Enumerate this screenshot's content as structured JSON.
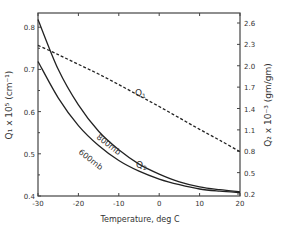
{
  "chart_data": {
    "type": "line",
    "title": "",
    "xlabel": "Temperature, deg C",
    "ylabel_left": "Q1 x 10^5 (cm^-1)",
    "ylabel_right": "Q2 x 10^-3 (gm/gm)",
    "xlim": [
      -30,
      20
    ],
    "ylim_left": [
      0.4,
      0.82
    ],
    "ylim_right": [
      0.2,
      2.6
    ],
    "x_ticks": [
      "-30",
      "-20",
      "-10",
      "0",
      "10",
      "20"
    ],
    "y_left_ticks": [
      "0.4",
      "0.5",
      "0.6",
      "0.7",
      "0.8"
    ],
    "y_right_ticks": [
      "0.2",
      "0.5",
      "0.8",
      "1.1",
      "1.4",
      "1.7",
      "2.0",
      "2.3",
      "2.6"
    ],
    "grid": false,
    "series": [
      {
        "name": "Q1",
        "axis": "left",
        "style": "dashed",
        "x": [
          -30,
          -25,
          -20,
          -15,
          -10,
          -5,
          0,
          5,
          10,
          15,
          20
        ],
        "values": [
          0.757,
          0.735,
          0.712,
          0.689,
          0.664,
          0.638,
          0.612,
          0.585,
          0.558,
          0.532,
          0.505
        ]
      },
      {
        "name": "Q2 800mb",
        "axis": "right",
        "style": "solid",
        "x": [
          -30,
          -25,
          -20,
          -15,
          -10,
          -5,
          0,
          5,
          10,
          15,
          20
        ],
        "values": [
          2.65,
          1.95,
          1.45,
          1.08,
          0.82,
          0.62,
          0.48,
          0.37,
          0.3,
          0.26,
          0.23
        ]
      },
      {
        "name": "Q2 600mb",
        "axis": "right",
        "style": "solid",
        "x": [
          -30,
          -25,
          -20,
          -15,
          -10,
          -5,
          0,
          5,
          10,
          15,
          20
        ],
        "values": [
          2.06,
          1.55,
          1.16,
          0.88,
          0.67,
          0.52,
          0.41,
          0.33,
          0.27,
          0.24,
          0.22
        ]
      }
    ],
    "annotations": [
      "Q1",
      "Q2",
      "800mb",
      "600mb"
    ]
  },
  "labels": {
    "xlabel": "Temperature, deg C",
    "q1": "Q",
    "q1_sub": "1",
    "q2": "Q",
    "q2_sub": "2",
    "mb800": "800mb",
    "mb600": "600mb",
    "yleft": "Q₁ x 10⁵ (cm⁻¹)",
    "yright": "Q₂ x 10⁻³ (gm/gm)"
  }
}
